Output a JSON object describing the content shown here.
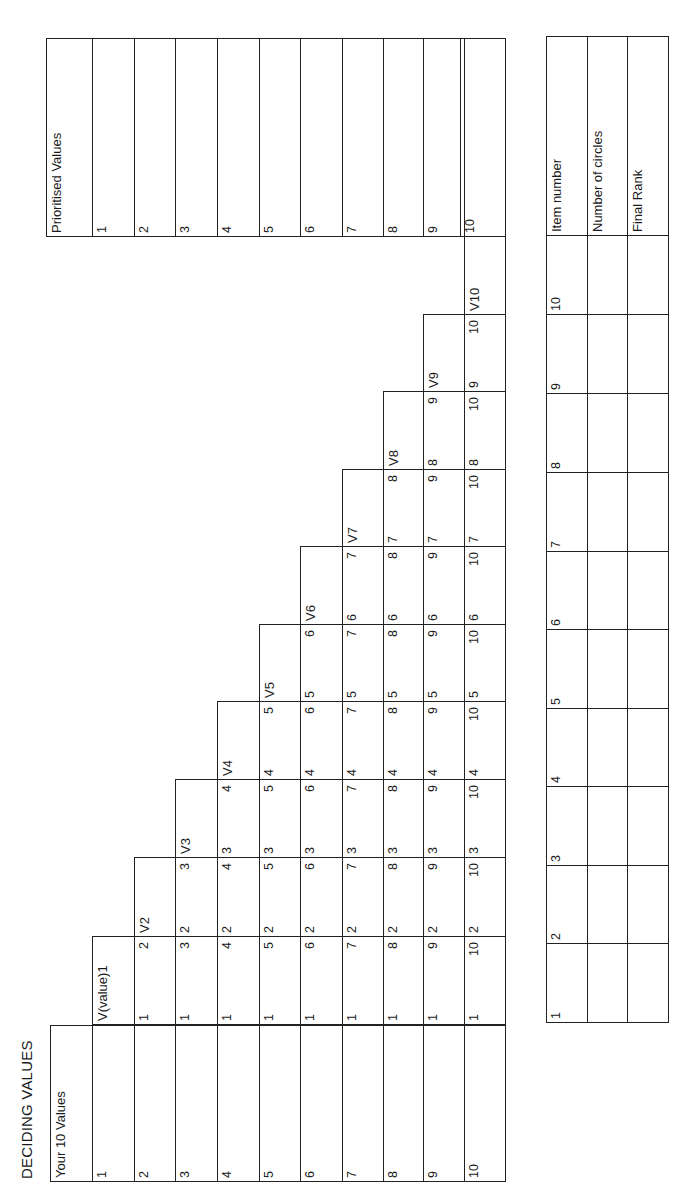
{
  "title": "DECIDING VALUES",
  "values_table": {
    "header": "Your 10 Values",
    "row_labels": [
      "1",
      "2",
      "3",
      "4",
      "5",
      "6",
      "7",
      "8",
      "9",
      "10"
    ],
    "comparison_columns": [
      {
        "header": "V(value)1",
        "pairs": [
          [
            "1",
            "2"
          ],
          [
            "1",
            "3"
          ],
          [
            "1",
            "4"
          ],
          [
            "1",
            "5"
          ],
          [
            "1",
            "6"
          ],
          [
            "1",
            "7"
          ],
          [
            "1",
            "8"
          ],
          [
            "1",
            "9"
          ],
          [
            "1",
            "10"
          ]
        ]
      },
      {
        "header": "V2",
        "pairs": [
          [
            "2",
            "3"
          ],
          [
            "2",
            "4"
          ],
          [
            "2",
            "5"
          ],
          [
            "2",
            "6"
          ],
          [
            "2",
            "7"
          ],
          [
            "2",
            "8"
          ],
          [
            "2",
            "9"
          ],
          [
            "2",
            "10"
          ]
        ]
      },
      {
        "header": "V3",
        "pairs": [
          [
            "3",
            "4"
          ],
          [
            "3",
            "5"
          ],
          [
            "3",
            "6"
          ],
          [
            "3",
            "7"
          ],
          [
            "3",
            "8"
          ],
          [
            "3",
            "9"
          ],
          [
            "3",
            "10"
          ]
        ]
      },
      {
        "header": "V4",
        "pairs": [
          [
            "4",
            "5"
          ],
          [
            "4",
            "6"
          ],
          [
            "4",
            "7"
          ],
          [
            "4",
            "8"
          ],
          [
            "4",
            "9"
          ],
          [
            "4",
            "10"
          ]
        ]
      },
      {
        "header": "V5",
        "pairs": [
          [
            "5",
            "6"
          ],
          [
            "5",
            "7"
          ],
          [
            "5",
            "8"
          ],
          [
            "5",
            "9"
          ],
          [
            "5",
            "10"
          ]
        ]
      },
      {
        "header": "V6",
        "pairs": [
          [
            "6",
            "7"
          ],
          [
            "6",
            "8"
          ],
          [
            "6",
            "9"
          ],
          [
            "6",
            "10"
          ]
        ]
      },
      {
        "header": "V7",
        "pairs": [
          [
            "7",
            "8"
          ],
          [
            "7",
            "9"
          ],
          [
            "7",
            "10"
          ]
        ]
      },
      {
        "header": "V8",
        "pairs": [
          [
            "8",
            "9"
          ],
          [
            "8",
            "10"
          ]
        ]
      },
      {
        "header": "V9",
        "pairs": [
          [
            "9",
            "10"
          ]
        ]
      },
      {
        "header": "V10",
        "pairs": []
      }
    ]
  },
  "prioritised_table": {
    "header": "Prioritised Values",
    "row_labels": [
      "1",
      "2",
      "3",
      "4",
      "5",
      "6",
      "7",
      "8",
      "9",
      "10"
    ]
  },
  "scoring_table": {
    "row_headers": [
      "Item number",
      "Number of circles",
      "Final Rank"
    ],
    "item_numbers": [
      "1",
      "2",
      "3",
      "4",
      "5",
      "6",
      "7",
      "8",
      "9",
      "10"
    ]
  }
}
